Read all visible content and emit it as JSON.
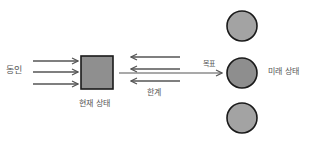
{
  "labels": {
    "driving_forces": "동인",
    "current_state": "현재 상태",
    "goal": "목표",
    "restraining_forces": "한계",
    "future_state": "미래 상태"
  },
  "colors": {
    "shape_fill": "#8f8f8f",
    "circle_fill": "#a3a3a3",
    "circle_fill_mid": "#8e8e8e",
    "stroke": "#1a1a1a",
    "arrow": "#555555",
    "text": "#555555"
  },
  "shapes": {
    "current_state_box": {
      "x": 81,
      "y": 56,
      "w": 32,
      "h": 33
    },
    "future_circles": [
      {
        "cx": 242,
        "cy": 26,
        "r": 15
      },
      {
        "cx": 242,
        "cy": 73,
        "r": 15
      },
      {
        "cx": 242,
        "cy": 118,
        "r": 15
      }
    ],
    "driving_arrows_y": [
      61,
      72,
      84
    ],
    "restraining_arrows_y": [
      57,
      69,
      81
    ]
  }
}
